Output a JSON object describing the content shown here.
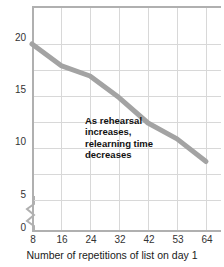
{
  "chart_data": {
    "type": "line",
    "title": "",
    "xlabel": "Number of repetitions of list on day 1",
    "ylabel": "",
    "x": [
      8,
      16,
      24,
      32,
      42,
      53,
      64
    ],
    "categories": [
      "8",
      "16",
      "24",
      "32",
      "42",
      "53",
      "64"
    ],
    "values": [
      20.0,
      17.7,
      16.6,
      14.3,
      11.6,
      9.9,
      7.5
    ],
    "series": [
      {
        "name": "Relearning time",
        "values": [
          20.0,
          17.7,
          16.6,
          14.3,
          11.6,
          9.9,
          7.5
        ]
      }
    ],
    "xtick_labels": [
      "8",
      "16",
      "24",
      "32",
      "42",
      "53",
      "64"
    ],
    "ytick_labels": [
      "0",
      "5",
      "10",
      "15",
      "20"
    ],
    "ytick_values": [
      0,
      5,
      10,
      15,
      20
    ],
    "ylim": [
      0,
      22.5
    ],
    "grid": true,
    "legend": "none",
    "y_axis_break": true,
    "annotations": [
      {
        "text": "As rehearsal increases, relearning time decreases",
        "line1": "As rehearsal",
        "line2": "increases,",
        "line3": "relearning time",
        "line4": "decreases"
      }
    ],
    "colors": {
      "line": "#a3a3a3",
      "grid": "#d8d8d8",
      "axis": "#b0b0b0",
      "text": "#1a1a1a",
      "background": "#ffffff"
    }
  },
  "axis": {
    "x_title": "Number of repetitions of list on day 1",
    "y_ticks": [
      "20",
      "15",
      "10",
      "5",
      "0"
    ],
    "x_ticks": [
      "8",
      "16",
      "24",
      "32",
      "42",
      "53",
      "64"
    ]
  },
  "annotation": {
    "line1": "As rehearsal",
    "line2": "increases,",
    "line3": "relearning time",
    "line4": "decreases"
  }
}
